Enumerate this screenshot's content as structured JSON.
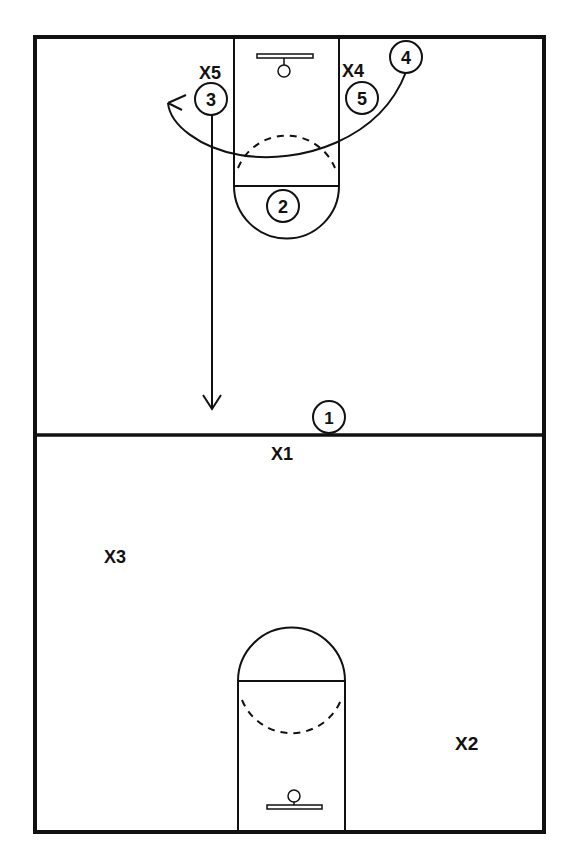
{
  "diagram": {
    "type": "basketball-play",
    "colors": {
      "line": "#111111",
      "background": "#ffffff"
    },
    "court": {
      "halfcourt_line": "present",
      "top_half": {
        "lane": "present",
        "free_throw_circle": "solid-bottom/dashed-top",
        "basket": "present"
      },
      "bottom_half": {
        "lane": "present",
        "free_throw_circle": "solid-top/dashed-bottom",
        "basket": "present"
      }
    },
    "offense": [
      {
        "id": "o1",
        "label": "1"
      },
      {
        "id": "o2",
        "label": "2"
      },
      {
        "id": "o3",
        "label": "3"
      },
      {
        "id": "o4",
        "label": "4"
      },
      {
        "id": "o5",
        "label": "5"
      }
    ],
    "defense": [
      {
        "id": "x1",
        "label": "X1"
      },
      {
        "id": "x2",
        "label": "X2"
      },
      {
        "id": "x3",
        "label": "X3"
      },
      {
        "id": "x4",
        "label": "X4"
      },
      {
        "id": "x5",
        "label": "X5"
      }
    ],
    "movements": [
      {
        "id": "cut-4-to-3",
        "from": "4",
        "to": "3 area",
        "style": "curved-arrow"
      },
      {
        "id": "cut-3-down",
        "from": "3",
        "to": "halfcourt",
        "style": "straight-arrow"
      }
    ]
  }
}
